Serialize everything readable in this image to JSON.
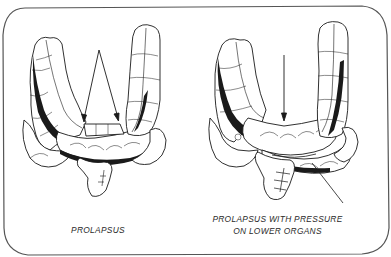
{
  "figure": {
    "panels": [
      {
        "id": "left",
        "caption": "PROLAPSUS",
        "arrow_count": 2
      },
      {
        "id": "right",
        "caption_line1": "PROLAPSUS WITH PRESSURE",
        "caption_line2": "ON LOWER  ORGANS",
        "arrow_count": 1,
        "pointer_line": true
      }
    ],
    "colors": {
      "ink": "#1a1a1a",
      "paper": "#ffffff",
      "border": "#555555"
    }
  }
}
